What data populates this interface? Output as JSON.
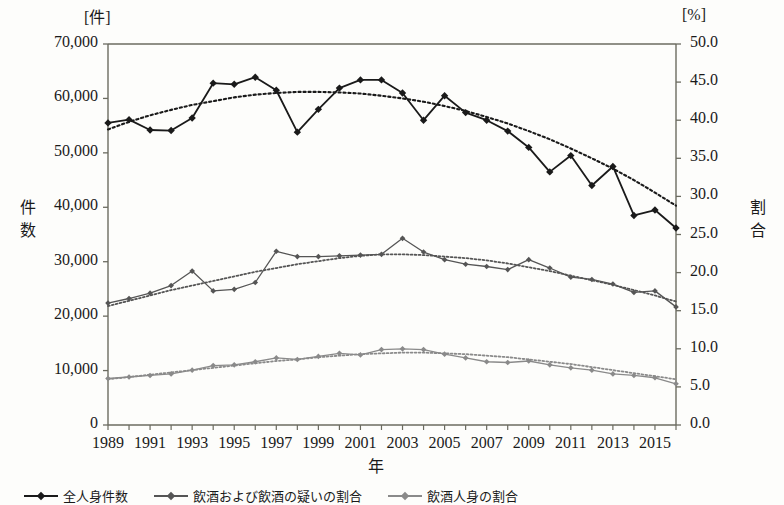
{
  "axes": {
    "left_unit": "[件]",
    "right_unit": "[%]",
    "left_title": "件数",
    "right_title": "割合",
    "x_title": "年",
    "left_ticks": [
      "70,000",
      "60,000",
      "50,000",
      "40,000",
      "30,000",
      "20,000",
      "10,000",
      "0"
    ],
    "right_ticks": [
      "50.0",
      "45.0",
      "40.0",
      "35.0",
      "30.0",
      "25.0",
      "20.0",
      "15.0",
      "10.0",
      "5.0",
      "0.0"
    ],
    "x_ticks": [
      "1989",
      "1991",
      "1993",
      "1995",
      "1997",
      "1999",
      "2001",
      "2003",
      "2005",
      "2007",
      "2009",
      "2011",
      "2013",
      "2015"
    ]
  },
  "legend": {
    "items": [
      {
        "label": "全人身件数",
        "color": "#1a1a1a",
        "marker": "diamond"
      },
      {
        "label": "飲酒および飲酒の疑いの割合",
        "color": "#555555",
        "marker": "diamond"
      },
      {
        "label": "飲酒人身の割合",
        "color": "#8a8a8a",
        "marker": "diamond"
      }
    ]
  },
  "chart_data": {
    "type": "line",
    "title": "",
    "xlabel": "年",
    "ylabel": "件数",
    "y2label": "割合",
    "xlim": [
      1989,
      2016
    ],
    "ylim": [
      0,
      70000
    ],
    "y2lim": [
      0,
      50.0
    ],
    "grid": false,
    "legend_position": "bottom",
    "x": [
      1989,
      1990,
      1991,
      1992,
      1993,
      1994,
      1995,
      1996,
      1997,
      1998,
      1999,
      2000,
      2001,
      2002,
      2003,
      2004,
      2005,
      2006,
      2007,
      2008,
      2009,
      2010,
      2011,
      2012,
      2013,
      2014,
      2015,
      2016
    ],
    "series": [
      {
        "name": "全人身件数",
        "axis": "left",
        "color": "#1a1a1a",
        "values": [
          55500,
          56100,
          54200,
          54100,
          56400,
          62800,
          62600,
          63900,
          61500,
          53800,
          58000,
          61900,
          63400,
          63400,
          61000,
          56000,
          60500,
          57400,
          56000,
          54000,
          51000,
          46500,
          49500,
          44000,
          47500,
          38500,
          39500,
          36200
        ],
        "trend": {
          "name": "全人身件数トレンド",
          "style": "dotted",
          "values": [
            54300,
            55700,
            56900,
            57900,
            58800,
            59500,
            60200,
            60700,
            61000,
            61200,
            61200,
            61100,
            60900,
            60500,
            60000,
            59400,
            58600,
            57700,
            56600,
            55400,
            54000,
            52500,
            50800,
            49000,
            47100,
            45000,
            42700,
            40300
          ]
        }
      },
      {
        "name": "飲酒および飲酒の疑いの割合",
        "axis": "right",
        "color": "#555555",
        "values": [
          16.0,
          16.6,
          17.3,
          18.3,
          20.2,
          17.6,
          17.8,
          18.7,
          22.8,
          22.1,
          22.1,
          22.2,
          22.3,
          22.4,
          24.5,
          22.7,
          21.7,
          21.1,
          20.8,
          20.4,
          21.7,
          20.6,
          19.4,
          19.1,
          18.5,
          17.4,
          17.6,
          15.5
        ],
        "trend": {
          "name": "飲酒および飲酒の疑いの割合トレンド",
          "style": "dotted",
          "values": [
            15.6,
            16.3,
            17.0,
            17.7,
            18.3,
            18.9,
            19.5,
            20.1,
            20.6,
            21.1,
            21.5,
            21.9,
            22.2,
            22.4,
            22.4,
            22.3,
            22.1,
            21.9,
            21.6,
            21.2,
            20.7,
            20.2,
            19.6,
            19.0,
            18.4,
            17.7,
            17.0,
            16.2
          ]
        }
      },
      {
        "name": "飲酒人身の割合",
        "axis": "right",
        "color": "#8a8a8a",
        "values": [
          6.1,
          6.3,
          6.5,
          6.7,
          7.2,
          7.8,
          7.9,
          8.3,
          8.8,
          8.6,
          9.0,
          9.4,
          9.2,
          9.9,
          10.0,
          9.9,
          9.3,
          8.8,
          8.3,
          8.2,
          8.4,
          7.9,
          7.5,
          7.2,
          6.7,
          6.5,
          6.2,
          5.4
        ],
        "trend": {
          "name": "飲酒人身の割合トレンド",
          "style": "dotted",
          "values": [
            6.0,
            6.3,
            6.6,
            6.9,
            7.2,
            7.5,
            7.8,
            8.1,
            8.4,
            8.6,
            8.9,
            9.1,
            9.3,
            9.4,
            9.5,
            9.5,
            9.4,
            9.3,
            9.1,
            8.9,
            8.6,
            8.3,
            8.0,
            7.6,
            7.2,
            6.8,
            6.4,
            6.0
          ]
        }
      }
    ]
  },
  "plot_box": {
    "left": 108,
    "right": 676,
    "top": 44,
    "bottom": 425
  }
}
